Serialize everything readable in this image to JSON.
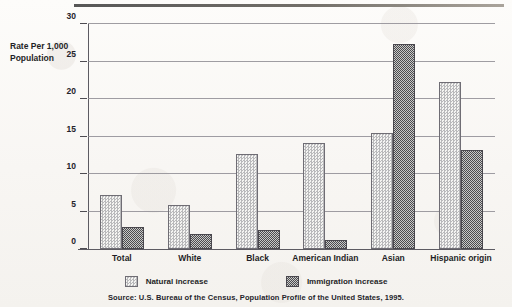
{
  "ylabel_text": "Rate Per 1,000 Population",
  "source_note": "Source: U.S. Bureau of the Census, Population Profile of the United States, 1995.",
  "legend": [
    {
      "label": "Natural increase",
      "swatch": "light-dither-swatch",
      "color": "#e9e9e7"
    },
    {
      "label": "Immigration increase",
      "swatch": "dark-dither-swatch",
      "color": "#7c7c7e"
    }
  ],
  "chart_data": {
    "type": "bar",
    "title": "",
    "subtitle": "",
    "xlabel": "",
    "ylabel": "Rate Per 1,000 Population",
    "ylim": [
      0,
      30
    ],
    "yticks": [
      0,
      5,
      10,
      15,
      20,
      25,
      30
    ],
    "ytick_labels": [
      "0",
      "5",
      "10",
      "15",
      "20",
      "25",
      "30"
    ],
    "grid": true,
    "legend_position": "bottom",
    "categories": [
      "Total",
      "White",
      "Black",
      "American Indian",
      "Asian",
      "Hispanic origin"
    ],
    "series": [
      {
        "name": "Natural increase",
        "color": "#e9e9e7",
        "values": [
          7.2,
          5.9,
          12.7,
          14.2,
          15.5,
          22.3
        ]
      },
      {
        "name": "Immigration increase",
        "color": "#7c7c7e",
        "values": [
          2.9,
          2.0,
          2.6,
          1.2,
          27.3,
          13.2
        ]
      }
    ]
  }
}
